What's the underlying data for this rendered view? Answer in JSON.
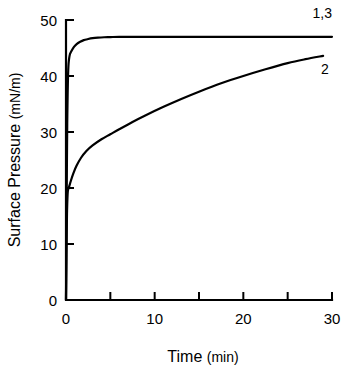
{
  "chart_data": {
    "type": "line",
    "title": "",
    "xlabel": "Time",
    "xunit": "(min)",
    "ylabel": "Surface Pressure",
    "yunit": "(mN/m)",
    "xlim": [
      0,
      30
    ],
    "ylim": [
      0,
      50
    ],
    "xticks": [
      0,
      10,
      20,
      30
    ],
    "xtick_labels": [
      "0",
      "10",
      "20",
      "30"
    ],
    "xminor_ticks": [
      5,
      15,
      25
    ],
    "yticks": [
      0,
      10,
      20,
      30,
      40,
      50
    ],
    "ytick_labels": [
      "0",
      "10",
      "20",
      "30",
      "40",
      "50"
    ],
    "grid": false,
    "legend_position": "inline-right",
    "series": [
      {
        "name": "1,3",
        "label": "1,3",
        "label_x": 30.0,
        "label_y": 50.0,
        "color": "#000000",
        "x": [
          0,
          0.05,
          0.1,
          0.15,
          0.25,
          0.4,
          0.6,
          0.9,
          1.2,
          1.6,
          2.0,
          2.5,
          3.0,
          3.6,
          4.3,
          5.0,
          6.0,
          8.0,
          10.0,
          13.0,
          16.0,
          20.0,
          24.0,
          27.0,
          30.0
        ],
        "y": [
          0,
          12.0,
          24.0,
          33.0,
          41.0,
          43.6,
          44.4,
          45.2,
          45.7,
          46.1,
          46.4,
          46.6,
          46.75,
          46.85,
          46.92,
          46.95,
          47.0,
          47.0,
          47.0,
          47.0,
          47.0,
          47.0,
          47.0,
          47.0,
          47.0
        ]
      },
      {
        "name": "2",
        "label": "2",
        "label_x": 29.2,
        "label_y": 41.0,
        "color": "#000000",
        "x": [
          0,
          0.04,
          0.08,
          0.12,
          0.2,
          0.35,
          0.55,
          0.85,
          1.2,
          1.7,
          2.3,
          3.0,
          4.0,
          5.0,
          6.0,
          7.5,
          9.0,
          11.0,
          13.0,
          15.0,
          17.5,
          20.0,
          22.5,
          25.0,
          27.0,
          29.0
        ],
        "y": [
          0,
          6.0,
          12.0,
          16.0,
          19.3,
          20.2,
          21.3,
          22.7,
          24.0,
          25.4,
          26.6,
          27.6,
          28.7,
          29.6,
          30.5,
          31.8,
          33.0,
          34.5,
          35.9,
          37.2,
          38.7,
          40.0,
          41.2,
          42.3,
          43.0,
          43.6
        ]
      }
    ]
  }
}
